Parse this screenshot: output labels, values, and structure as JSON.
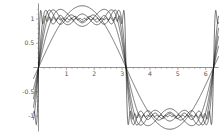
{
  "chart_data": {
    "type": "line",
    "title": "",
    "subtitle": "",
    "xlabel": "",
    "ylabel": "",
    "xlim": [
      -0.18,
      6.46
    ],
    "ylim": [
      -1.32,
      1.32
    ],
    "grid": false,
    "legend": "none",
    "background_color": "#ffffff",
    "line_color": "#1a1a1a",
    "axis_color": "#666666",
    "tick_label_color": "#555555",
    "function_family": "f_N(x) = (4/pi) * sum over odd k from 1 to N of sin(k x)/k, normalized so the square wave amplitude is 1",
    "x_ticks": [
      1,
      2,
      3,
      4,
      5,
      6
    ],
    "x_tick_labels": [
      "1",
      "2",
      "3",
      "4",
      "5",
      "6"
    ],
    "x_minor_ticks": [
      0.2,
      0.4,
      0.6,
      0.8,
      1.2,
      1.4,
      1.6,
      1.8,
      2.2,
      2.4,
      2.6,
      2.8,
      3.2,
      3.4,
      3.6,
      3.8,
      4.2,
      4.4,
      4.6,
      4.8,
      5.2,
      5.4,
      5.6,
      5.8,
      6.2
    ],
    "y_ticks": [
      -1,
      -0.5,
      0.5,
      1
    ],
    "y_tick_labels": [
      "-1",
      "-0.5",
      "0.5",
      "1"
    ],
    "y_minor_ticks": [
      -1.2,
      -0.9,
      -0.8,
      -0.7,
      -0.6,
      -0.4,
      -0.3,
      -0.2,
      -0.1,
      0.1,
      0.2,
      0.3,
      0.4,
      0.6,
      0.7,
      0.8,
      0.9,
      1.1,
      1.2
    ],
    "axis_origin": [
      0,
      0
    ],
    "series": [
      {
        "name": "N = 1 term",
        "harmonics": [
          1
        ],
        "note": "smoothest, lowest amplitude arc, peak about 0.64"
      },
      {
        "name": "N = 2 terms",
        "harmonics": [
          1,
          3
        ],
        "note": "peak about 0.78"
      },
      {
        "name": "N = 3 terms",
        "harmonics": [
          1,
          3,
          5
        ],
        "note": "peak about 0.84"
      },
      {
        "name": "N = 4 terms",
        "harmonics": [
          1,
          3,
          5,
          7
        ],
        "note": "peak about 0.88"
      },
      {
        "name": "N = 6 terms",
        "harmonics": [
          1,
          3,
          5,
          7,
          9,
          11
        ],
        "note": "peak about 0.93"
      },
      {
        "name": "N = 20 terms",
        "harmonics": "odd 1..39",
        "note": "strong ringing, Gibbs overshoot about 1.18 near the jumps"
      }
    ],
    "annotations": [
      {
        "text": "jump discontinuity at x = pi",
        "x": 3.1416,
        "y": 0
      },
      {
        "text": "jump discontinuity at x = 0 and x = 2 pi",
        "x": 0,
        "y": 0
      }
    ],
    "gibbs_overshoot": 1.179
  },
  "figure": {
    "axis_names": {
      "x": "horizontal-axis",
      "y": "vertical-axis"
    }
  }
}
